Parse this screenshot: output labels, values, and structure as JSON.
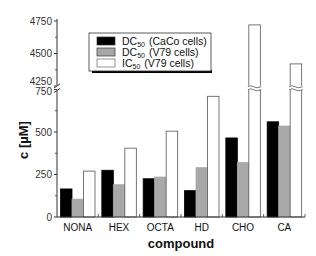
{
  "chart_data": {
    "type": "bar",
    "title": "",
    "xlabel": "compound",
    "ylabel": "c [µM]",
    "categories": [
      "NONA",
      "HEX",
      "OCTA",
      "HD",
      "CHO",
      "CA"
    ],
    "series": [
      {
        "name": "DC50 (CaCo cells)",
        "label_main": "DC",
        "label_sub": "50",
        "label_rest": "(CaCo cells)",
        "color": "#000000",
        "values": [
          165,
          275,
          225,
          155,
          465,
          560
        ]
      },
      {
        "name": "DC50 (V79 cells)",
        "label_main": "DC",
        "label_sub": "50",
        "label_rest": "(V79 cells)",
        "color": "#a8a8a8",
        "values": [
          105,
          190,
          235,
          290,
          320,
          535
        ]
      },
      {
        "name": "IC50 (V79 cells)",
        "label_main": "IC",
        "label_sub": "50",
        "label_rest": "(V79 cells)",
        "color": "#ffffff",
        "values": [
          270,
          405,
          505,
          710,
          4720,
          4420
        ]
      }
    ],
    "y_axis_break": {
      "lower_range": [
        0,
        750
      ],
      "upper_range": [
        4250,
        4750
      ]
    },
    "lower_ticks": [
      0,
      250,
      500,
      750
    ],
    "upper_ticks": [
      4250,
      4500,
      4750
    ],
    "grid": false,
    "legend_position": "upper-left-inside"
  }
}
